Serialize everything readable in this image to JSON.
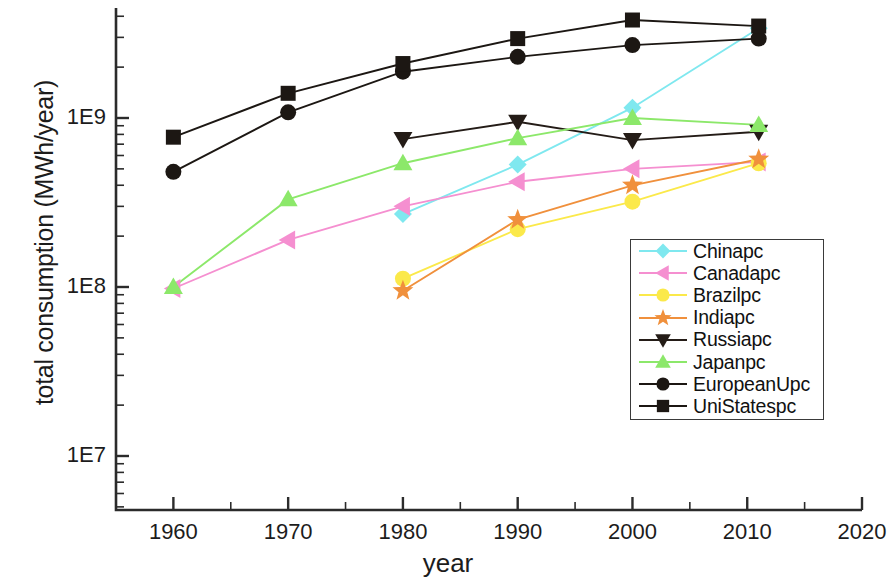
{
  "chart_data": {
    "type": "line",
    "title": "",
    "xlabel": "year",
    "ylabel": "total consumption (MWh/year)",
    "yscale": "log",
    "xscale": "linear",
    "xlim": [
      1955,
      2020
    ],
    "ylim": [
      5000000,
      5000000000
    ],
    "xticks": [
      "1960",
      "1970",
      "1980",
      "1990",
      "2000",
      "2010",
      "2020"
    ],
    "xtick_values": [
      1960,
      1970,
      1980,
      1990,
      2000,
      2010,
      2020
    ],
    "yticks": [
      "1E7",
      "1E8",
      "1E9"
    ],
    "ytick_values": [
      10000000,
      100000000,
      1000000000
    ],
    "grid": false,
    "legend_position": "center-right",
    "x": [
      1960,
      1970,
      1980,
      1990,
      2000,
      2011
    ],
    "series": [
      {
        "name": "Chinapc",
        "color": "#7fe8ef",
        "marker": "diamond",
        "x": [
          1980,
          1990,
          2000,
          2011
        ],
        "values": [
          270000000,
          530000000,
          1150000000,
          3400000000
        ]
      },
      {
        "name": "Canadapc",
        "color": "#f58fd0",
        "marker": "left-triangle",
        "x": [
          1960,
          1970,
          1980,
          1990,
          2000,
          2011
        ],
        "values": [
          98000000,
          190000000,
          300000000,
          420000000,
          500000000,
          550000000
        ]
      },
      {
        "name": "Brazilpc",
        "color": "#fbe94a",
        "marker": "circle",
        "x": [
          1980,
          1990,
          2000,
          2011
        ],
        "values": [
          112000000,
          220000000,
          320000000,
          540000000
        ]
      },
      {
        "name": "Indiapc",
        "color": "#f0903c",
        "marker": "star",
        "x": [
          1980,
          1990,
          2000,
          2011
        ],
        "values": [
          95000000,
          250000000,
          400000000,
          570000000
        ]
      },
      {
        "name": "Russiapc",
        "color": "#241c17",
        "marker": "down-triangle",
        "x": [
          1980,
          1990,
          2000,
          2011
        ],
        "values": [
          750000000,
          950000000,
          740000000,
          830000000
        ]
      },
      {
        "name": "Japanpc",
        "color": "#8ce86a",
        "marker": "up-triangle",
        "x": [
          1960,
          1970,
          1980,
          1990,
          2000,
          2011
        ],
        "values": [
          100000000,
          330000000,
          540000000,
          760000000,
          1000000000,
          910000000
        ]
      },
      {
        "name": "EuropeanUpc",
        "color": "#1c1713",
        "marker": "circle",
        "x": [
          1960,
          1970,
          1980,
          1990,
          2000,
          2011
        ],
        "values": [
          480000000,
          1080000000,
          1880000000,
          2300000000,
          2700000000,
          2950000000
        ]
      },
      {
        "name": "UniStatespc",
        "color": "#1c1713",
        "marker": "square",
        "x": [
          1960,
          1970,
          1980,
          1990,
          2000,
          2011
        ],
        "values": [
          770000000,
          1400000000,
          2100000000,
          2950000000,
          3800000000,
          3500000000
        ]
      }
    ]
  },
  "legend": {
    "items": [
      {
        "label": "Chinapc",
        "marker": "diamond-icon",
        "color": "#7fe8ef"
      },
      {
        "label": "Canadapc",
        "marker": "left-triangle-icon",
        "color": "#f58fd0"
      },
      {
        "label": "Brazilpc",
        "marker": "circle-icon",
        "color": "#fbe94a"
      },
      {
        "label": "Indiapc",
        "marker": "star-icon",
        "color": "#f0903c"
      },
      {
        "label": "Russiapc",
        "marker": "down-triangle-icon",
        "color": "#241c17"
      },
      {
        "label": "Japanpc",
        "marker": "up-triangle-icon",
        "color": "#8ce86a"
      },
      {
        "label": "EuropeanUpc",
        "marker": "circle-icon",
        "color": "#1c1713"
      },
      {
        "label": "UniStatespc",
        "marker": "square-icon",
        "color": "#1c1713"
      }
    ]
  },
  "axes": {
    "x_title": "year",
    "y_title": "total consumption (MWh/year)",
    "x_tick_labels": [
      "1960",
      "1970",
      "1980",
      "1990",
      "2000",
      "2010",
      "2020"
    ],
    "y_tick_labels": [
      "1E7",
      "1E8",
      "1E9"
    ]
  }
}
